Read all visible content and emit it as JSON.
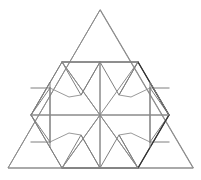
{
  "figure": {
    "type": "geometric-line-drawing",
    "background_color": "#ffffff",
    "canvas": {
      "width": 201,
      "height": 180
    },
    "colors": {
      "outline": "#8d8d8d",
      "inner_lines": "#7f7f7f",
      "star_lines": "#9a9a9a",
      "highlight": "#333333",
      "rays": "#8a8a8a"
    },
    "points": {
      "apex": [
        100,
        10
      ],
      "bottom_left": [
        8,
        168
      ],
      "bottom_right": [
        193,
        168
      ],
      "upper_left": [
        62,
        62
      ],
      "top_mid": [
        100,
        62
      ],
      "upper_right": [
        138,
        62
      ],
      "mid_left": [
        31,
        115
      ],
      "center": [
        100,
        115
      ],
      "mid_right": [
        169,
        115
      ],
      "low_left": [
        62,
        168
      ],
      "bottom_mid": [
        100,
        168
      ],
      "low_right": [
        138,
        168
      ],
      "nl_top_a": [
        81,
        88
      ],
      "nl_top_b": [
        119,
        88
      ],
      "nl_bot_a": [
        81,
        142
      ],
      "nl_bot_b": [
        119,
        142
      ],
      "left_notch": [
        50,
        115
      ],
      "right_notch": [
        150,
        115
      ],
      "star_up": [
        100,
        88
      ],
      "star_dn": [
        100,
        142
      ],
      "hex_ul": [
        69,
        97
      ],
      "hex_ur": [
        131,
        97
      ],
      "hex_ll": [
        69,
        133
      ],
      "hex_lr": [
        131,
        133
      ]
    },
    "outer_triangle": {
      "label": "outer-triangle",
      "vertices": [
        [
          100,
          10
        ],
        [
          8,
          168
        ],
        [
          193,
          168
        ]
      ]
    },
    "hexagon": {
      "label": "inner-hexagon",
      "vertices": [
        [
          62,
          62
        ],
        [
          138,
          62
        ],
        [
          169,
          115
        ],
        [
          138,
          168
        ],
        [
          62,
          168
        ],
        [
          31,
          115
        ]
      ]
    },
    "notch_triangles": [
      {
        "label": "notch-top-left",
        "vertices": [
          [
            62,
            62
          ],
          [
            100,
            62
          ],
          [
            81,
            95
          ]
        ]
      },
      {
        "label": "notch-top-right",
        "vertices": [
          [
            100,
            62
          ],
          [
            138,
            62
          ],
          [
            119,
            95
          ]
        ]
      },
      {
        "label": "notch-left",
        "vertices": [
          [
            31,
            115
          ],
          [
            50,
            82
          ],
          [
            50,
            148
          ]
        ]
      },
      {
        "label": "notch-right",
        "vertices": [
          [
            169,
            115
          ],
          [
            150,
            82
          ],
          [
            150,
            148
          ]
        ]
      },
      {
        "label": "notch-bottom-left",
        "vertices": [
          [
            62,
            168
          ],
          [
            100,
            168
          ],
          [
            81,
            135
          ]
        ]
      },
      {
        "label": "notch-bottom-right",
        "vertices": [
          [
            100,
            168
          ],
          [
            138,
            168
          ],
          [
            119,
            135
          ]
        ]
      }
    ],
    "radial_rays": {
      "label": "center-rays",
      "from": [
        100,
        115
      ],
      "to": [
        [
          100,
          62
        ],
        [
          169,
          115
        ],
        [
          138,
          168
        ],
        [
          100,
          168
        ],
        [
          62,
          168
        ],
        [
          31,
          115
        ],
        [
          62,
          62
        ]
      ]
    },
    "star_points": 6,
    "highlight_edges": [
      {
        "label": "right-upper-edge",
        "from": [
          138,
          62
        ],
        "to": [
          169,
          115
        ]
      },
      {
        "label": "right-lower-edge",
        "from": [
          169,
          115
        ],
        "to": [
          138,
          168
        ]
      }
    ]
  }
}
